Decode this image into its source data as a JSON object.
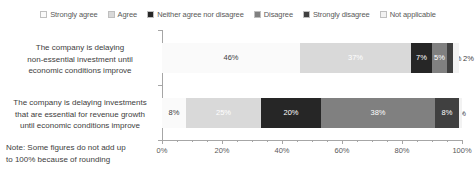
{
  "chart_data": {
    "type": "bar",
    "orientation": "horizontal",
    "stacked": true,
    "stack_mode": "percent",
    "title": "",
    "xlabel": "",
    "ylabel": "",
    "xlim": [
      0,
      100
    ],
    "grid": false,
    "legend_position": "top",
    "axis_tick_labels": [
      "0%",
      "20%",
      "40%",
      "60%",
      "80%",
      "100%"
    ],
    "axis_tick_values": [
      0,
      20,
      40,
      60,
      80,
      100
    ],
    "minor_tick_interval": 5,
    "categories": [
      "The company is delaying non-essential investment until economic conditions improve",
      "The company is delaying investments that are essential for revenue growth until economic conditions improve"
    ],
    "category_lines": [
      [
        "The company is delaying",
        "non-essential investment until",
        "economic conditions improve"
      ],
      [
        "The company is delaying investments",
        "that are essential for revenue growth",
        "until economic conditions improve"
      ]
    ],
    "series": [
      {
        "name": "Strongly agree",
        "color": "#fafafa",
        "text_color": "#404040",
        "values": [
          46,
          8
        ],
        "labels": [
          "46%",
          "8%"
        ]
      },
      {
        "name": "Agree",
        "color": "#d9d9d9",
        "text_color": "#ffffff",
        "values": [
          37,
          25
        ],
        "labels": [
          "37%",
          "25%"
        ]
      },
      {
        "name": "Neither agree nor disagree",
        "color": "#262626",
        "text_color": "#ffffff",
        "values": [
          7,
          20
        ],
        "labels": [
          "7%",
          "20%"
        ]
      },
      {
        "name": "Disagree",
        "color": "#808080",
        "text_color": "#ffffff",
        "values": [
          5,
          38
        ],
        "labels": [
          "5%",
          "38%"
        ]
      },
      {
        "name": "Strongly disagree",
        "color": "#404040",
        "text_color": "#ffffff",
        "values": [
          2,
          8
        ],
        "labels": [
          "2%",
          "8%"
        ]
      },
      {
        "name": "Not applicable",
        "color": "#f2f2f2",
        "text_color": "#404040",
        "values": [
          2,
          1
        ],
        "labels": [
          "2%",
          "1%"
        ]
      }
    ],
    "note": "Note: Some figures do not add up to 100% because of rounding",
    "note_lines": [
      "Note: Some figures do not add up",
      "to 100% because of rounding"
    ]
  },
  "legend": {
    "items": [
      {
        "label": "Strongly agree",
        "color": "#fafafa"
      },
      {
        "label": "Agree",
        "color": "#d9d9d9"
      },
      {
        "label": "Neither agree nor disagree",
        "color": "#262626"
      },
      {
        "label": "Disagree",
        "color": "#808080"
      },
      {
        "label": "Strongly disagree",
        "color": "#404040"
      },
      {
        "label": "Not applicable",
        "color": "#f2f2f2"
      }
    ]
  }
}
